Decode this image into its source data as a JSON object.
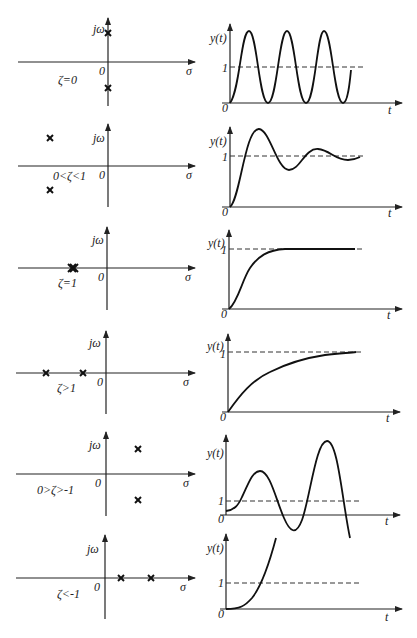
{
  "colors": {
    "ink": "#111111",
    "background": "#ffffff"
  },
  "axis_labels": {
    "imag": "jω",
    "real": "σ",
    "origin": "0",
    "response": "y(t)",
    "time": "t",
    "steady_state": "1"
  },
  "rows": [
    {
      "condition": "ζ=0",
      "poles": "conjugate imaginary pair on jω axis",
      "response": "sustained oscillation about 1 (0 to 2)"
    },
    {
      "condition": "0<ζ<1",
      "poles": "complex conjugate pair in left half-plane",
      "response": "damped oscillation settling to 1"
    },
    {
      "condition": "ζ=1",
      "poles": "repeated real pole on negative σ axis",
      "response": "critically damped, rises to 1"
    },
    {
      "condition": "ζ>1",
      "poles": "two distinct real poles on negative σ axis",
      "response": "overdamped, slow rise to 1"
    },
    {
      "condition": "0>ζ>-1",
      "poles": "complex conjugate pair in right half-plane",
      "response": "growing oscillation"
    },
    {
      "condition": "ζ<-1",
      "poles": "two distinct real poles on positive σ axis",
      "response": "exponential divergence"
    }
  ]
}
